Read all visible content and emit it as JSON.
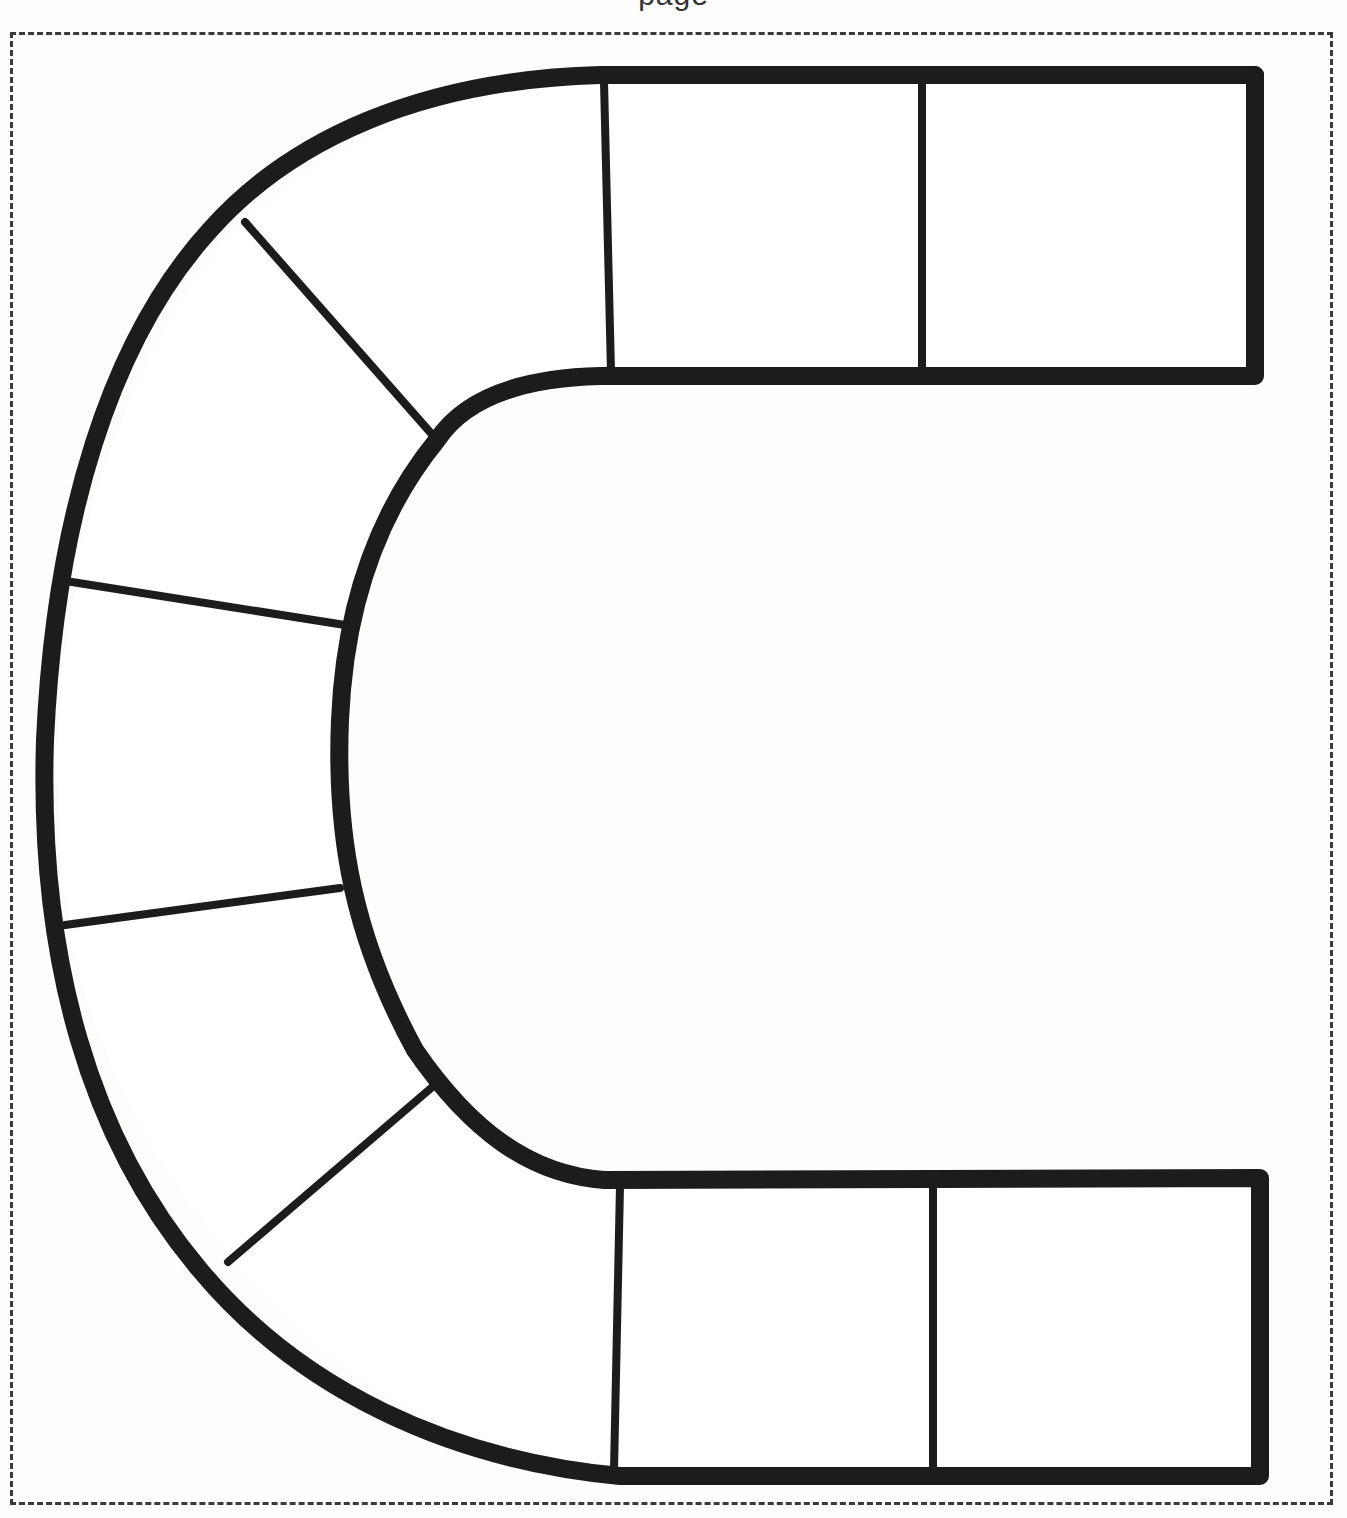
{
  "page": {
    "header_fragment": "page",
    "cut_line": "dashed"
  },
  "board": {
    "shape": "C-shaped track (horseshoe), opening to the right",
    "space_count": 10,
    "line_color": "#1c1c1c",
    "paper_color": "#fdfdfc",
    "border_color": "#3a3a3a",
    "spaces": [
      {
        "id": 1,
        "section": "top-right-end",
        "label": ""
      },
      {
        "id": 2,
        "section": "top-straight",
        "label": ""
      },
      {
        "id": 3,
        "section": "top-curve",
        "label": ""
      },
      {
        "id": 4,
        "section": "upper-left-curve",
        "label": ""
      },
      {
        "id": 5,
        "section": "left-side",
        "label": ""
      },
      {
        "id": 6,
        "section": "lower-left-curve",
        "label": ""
      },
      {
        "id": 7,
        "section": "bottom-curve",
        "label": ""
      },
      {
        "id": 8,
        "section": "bottom-straight",
        "label": ""
      },
      {
        "id": 9,
        "section": "bottom-right-end",
        "label": ""
      }
    ]
  }
}
